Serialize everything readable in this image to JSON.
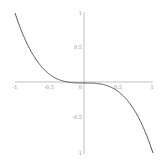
{
  "chart_data": {
    "type": "line",
    "title": "",
    "xlabel": "",
    "ylabel": "",
    "function": "y = -x^3",
    "xlim": [
      -1,
      1
    ],
    "ylim": [
      -1,
      1
    ],
    "grid": false,
    "legend": null,
    "x_ticks": [
      "-1",
      "-0.5",
      "0",
      "0.5",
      "1"
    ],
    "y_ticks": [
      "1",
      "0.5",
      "-0.5",
      "-1"
    ],
    "series": [
      {
        "name": "-x^3",
        "color": "#444444",
        "x": [
          -1,
          -0.75,
          -0.5,
          -0.25,
          0,
          0.25,
          0.5,
          0.75,
          1
        ],
        "values": [
          1,
          0.422,
          0.125,
          0.016,
          0,
          -0.016,
          -0.125,
          -0.422,
          -1
        ]
      }
    ]
  },
  "colors": {
    "axis": "#b0b0b0",
    "curve": "#444444",
    "tick_label": "#8a8a8a"
  },
  "labels": {
    "x_neg1": "-1",
    "x_neg05": "-0.5",
    "x_0": "0",
    "x_05": "0.5",
    "x_1": "1",
    "y_1": "1",
    "y_05": "0.5",
    "y_neg05": "-0.5",
    "y_neg1": "-1"
  }
}
